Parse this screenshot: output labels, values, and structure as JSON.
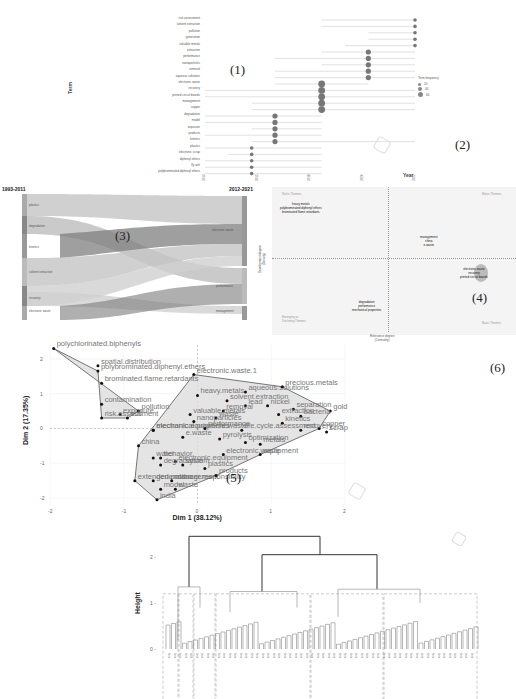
{
  "panels": {
    "p1": {
      "label": "(1)"
    },
    "p2": {
      "label": "(2)"
    },
    "p3": {
      "label": "(3)"
    },
    "p4": {
      "label": "(4)"
    },
    "p5": {
      "label": "(5)"
    },
    "p6": {
      "label": "(6)"
    }
  },
  "chart_data": [
    {
      "type": "scatter",
      "title": "Trend Topics",
      "xlabel": "Year",
      "ylabel": "Term",
      "x_ticks": [
        "2013",
        "2015",
        "2018",
        "2020",
        "2022"
      ],
      "legend": {
        "title": "Term frequency",
        "entries": [
          "20",
          "40",
          "60"
        ],
        "position": "right"
      },
      "terms": [
        {
          "term": "risk assessment",
          "year": 2022,
          "start": 2018,
          "end": 2022,
          "size": 1
        },
        {
          "term": "solvent extraction",
          "year": 2022,
          "start": 2018,
          "end": 2022,
          "size": 1
        },
        {
          "term": "pollution",
          "year": 2022,
          "start": 2020,
          "end": 2022,
          "size": 1
        },
        {
          "term": "generation",
          "year": 2022,
          "start": 2020,
          "end": 2022,
          "size": 1
        },
        {
          "term": "valuable metals",
          "year": 2022,
          "start": 2019,
          "end": 2022,
          "size": 1
        },
        {
          "term": "extraction",
          "year": 2020,
          "start": 2018,
          "end": 2022,
          "size": 2
        },
        {
          "term": "performance",
          "year": 2020,
          "start": 2016,
          "end": 2022,
          "size": 2
        },
        {
          "term": "nanoparticles",
          "year": 2020,
          "start": 2018,
          "end": 2022,
          "size": 2
        },
        {
          "term": "removal",
          "year": 2020,
          "start": 2016,
          "end": 2022,
          "size": 2
        },
        {
          "term": "aqueous solutions",
          "year": 2020,
          "start": 2016,
          "end": 2022,
          "size": 2
        },
        {
          "term": "electronic waste",
          "year": 2018,
          "start": 2016,
          "end": 2020,
          "size": 3
        },
        {
          "term": "recovery",
          "year": 2018,
          "start": 2013,
          "end": 2022,
          "size": 3
        },
        {
          "term": "printed circuit boards",
          "year": 2018,
          "start": 2013,
          "end": 2022,
          "size": 3
        },
        {
          "term": "management",
          "year": 2018,
          "start": 2015,
          "end": 2022,
          "size": 3
        },
        {
          "term": "copper",
          "year": 2018,
          "start": 2015,
          "end": 2022,
          "size": 3
        },
        {
          "term": "degradation",
          "year": 2016,
          "start": 2013,
          "end": 2018,
          "size": 2
        },
        {
          "term": "model",
          "year": 2016,
          "start": 2013,
          "end": 2018,
          "size": 2
        },
        {
          "term": "exposure",
          "year": 2016,
          "start": 2015,
          "end": 2018,
          "size": 2
        },
        {
          "term": "products",
          "year": 2016,
          "start": 2013,
          "end": 2018,
          "size": 2
        },
        {
          "term": "kinetics",
          "year": 2016,
          "start": 2015,
          "end": 2022,
          "size": 2
        },
        {
          "term": "plastics",
          "year": 2015,
          "start": 2013,
          "end": 2018,
          "size": 1
        },
        {
          "term": "electronic scrap",
          "year": 2015,
          "start": 2014,
          "end": 2018,
          "size": 1
        },
        {
          "term": "diphenyl ethers",
          "year": 2015,
          "start": 2013,
          "end": 2018,
          "size": 1
        },
        {
          "term": "fly ash",
          "year": 2015,
          "start": 2013,
          "end": 2018,
          "size": 1
        },
        {
          "term": "polybrominated diphenyl ethers",
          "year": 2015,
          "start": 2013,
          "end": 2018,
          "size": 1
        }
      ]
    },
    {
      "type": "sankey",
      "title": "Thematic Evolution",
      "periods": [
        "1993-2011",
        "2012-2021"
      ],
      "left_nodes": [
        "plastics",
        "degradation",
        "kinetics",
        "solvent extraction",
        "recovery",
        "electronic waste"
      ],
      "right_nodes": [
        "electronic waste",
        "performance",
        "management"
      ],
      "links": [
        {
          "from": "plastics",
          "to": "electronic waste"
        },
        {
          "from": "degradation",
          "to": "performance"
        },
        {
          "from": "kinetics",
          "to": "electronic waste"
        },
        {
          "from": "kinetics",
          "to": "performance"
        },
        {
          "from": "solvent extraction",
          "to": "electronic waste"
        },
        {
          "from": "solvent extraction",
          "to": "performance"
        },
        {
          "from": "recovery",
          "to": "electronic waste"
        },
        {
          "from": "recovery",
          "to": "management"
        },
        {
          "from": "electronic waste",
          "to": "electronic waste"
        },
        {
          "from": "electronic waste",
          "to": "management"
        }
      ]
    },
    {
      "type": "scatter",
      "title": "Thematic Map",
      "xlabel": "Relevance degree (Centrality)",
      "ylabel": "Development degree (Density)",
      "quadrants": [
        "Niche Themes",
        "Motor Themes",
        "Emerging or Declining Themes",
        "Basic Themes"
      ],
      "clusters": [
        {
          "terms": [
            "heavy metals",
            "polybrominated diphenyl ethers",
            "brominated flame retardants"
          ],
          "quadrant": "Niche Themes"
        },
        {
          "terms": [
            "management",
            "china",
            "e-waste"
          ],
          "quadrant": "Motor Themes"
        },
        {
          "terms": [
            "electronic waste",
            "recovery",
            "printed circuit boards"
          ],
          "quadrant": "Basic Themes"
        },
        {
          "terms": [
            "degradation",
            "performance",
            "mechanical properties"
          ],
          "quadrant": "Emerging or Declining Themes"
        }
      ]
    },
    {
      "type": "scatter",
      "title": "Factorial Map",
      "xlabel": "Dim 1 (38.12%)",
      "ylabel": "Dim 2 (17.35%)",
      "xlim": [
        -2,
        2
      ],
      "ylim": [
        -2.2,
        2.4
      ],
      "x_ticks": [
        "-2",
        "-1",
        "0",
        "1",
        "2"
      ],
      "y_ticks": [
        "2",
        "1",
        "0",
        "-1",
        "-2"
      ],
      "points": [
        {
          "label": "polychlorinated.biphenyls",
          "x": -1.95,
          "y": 2.3
        },
        {
          "label": "spatial.distribution",
          "x": -1.35,
          "y": 1.8
        },
        {
          "label": "polybrominated.diphenyl.ethers",
          "x": -1.35,
          "y": 1.65
        },
        {
          "label": "brominated.flame.retardants",
          "x": -1.3,
          "y": 1.3
        },
        {
          "label": "contamination",
          "x": -1.3,
          "y": 0.7
        },
        {
          "label": "pollution",
          "x": -0.8,
          "y": 0.5
        },
        {
          "label": "exposure",
          "x": -1.05,
          "y": 0.4
        },
        {
          "label": "soil",
          "x": -0.95,
          "y": 0.3
        },
        {
          "label": "risk.assessment",
          "x": -1.3,
          "y": 0.3
        },
        {
          "label": "electronic.waste.1",
          "x": -0.05,
          "y": 1.55
        },
        {
          "label": "aqueous.solutions",
          "x": 0.65,
          "y": 1.05
        },
        {
          "label": "precious.metals",
          "x": 1.15,
          "y": 1.2
        },
        {
          "label": "heavy.metals",
          "x": 0.0,
          "y": 0.95
        },
        {
          "label": "solvent.extraction",
          "x": 0.4,
          "y": 0.8
        },
        {
          "label": "lead",
          "x": 0.65,
          "y": 0.65
        },
        {
          "label": "nickel",
          "x": 0.95,
          "y": 0.65
        },
        {
          "label": "separation",
          "x": 1.3,
          "y": 0.55
        },
        {
          "label": "gold",
          "x": 1.8,
          "y": 0.5
        },
        {
          "label": "removal",
          "x": 0.35,
          "y": 0.5
        },
        {
          "label": "extraction",
          "x": 1.1,
          "y": 0.4
        },
        {
          "label": "bacteria",
          "x": 1.4,
          "y": 0.35
        },
        {
          "label": "valuable.metals",
          "x": -0.1,
          "y": 0.4
        },
        {
          "label": "waste",
          "x": 0.25,
          "y": 0.3
        },
        {
          "label": "kinetics",
          "x": 1.15,
          "y": 0.15
        },
        {
          "label": "copper",
          "x": 1.65,
          "y": 0.0
        },
        {
          "label": "nanoparticles",
          "x": -0.05,
          "y": 0.2
        },
        {
          "label": "recovery",
          "x": 1.4,
          "y": -0.05
        },
        {
          "label": "scrap",
          "x": 1.75,
          "y": -0.1
        },
        {
          "label": "electronic.equipment.waste",
          "x": -0.6,
          "y": -0.05
        },
        {
          "label": "mechanical.properties",
          "x": -0.6,
          "y": -0.05
        },
        {
          "label": "performance",
          "x": 0.1,
          "y": 0.0
        },
        {
          "label": "life.cycle.assessment",
          "x": 0.6,
          "y": -0.05
        },
        {
          "label": "china",
          "x": -0.8,
          "y": -0.5
        },
        {
          "label": "e.waste",
          "x": -0.2,
          "y": -0.25
        },
        {
          "label": "pyrolysis",
          "x": 0.3,
          "y": -0.3
        },
        {
          "label": "optimization",
          "x": 0.65,
          "y": -0.4
        },
        {
          "label": "metals",
          "x": 0.85,
          "y": -0.45
        },
        {
          "label": "water",
          "x": -0.6,
          "y": -0.85
        },
        {
          "label": "behavior",
          "x": -0.5,
          "y": -0.85
        },
        {
          "label": "electronic.equipment",
          "x": -0.3,
          "y": -0.95
        },
        {
          "label": "electronic.waste",
          "x": 0.35,
          "y": -0.75
        },
        {
          "label": "degradation",
          "x": -0.5,
          "y": -1.05
        },
        {
          "label": "system",
          "x": -0.2,
          "y": -1.05
        },
        {
          "label": "plastics",
          "x": 0.1,
          "y": -1.15
        },
        {
          "label": "equipment",
          "x": 0.85,
          "y": -0.75
        },
        {
          "label": "extended.producer.responsibility",
          "x": -0.85,
          "y": -1.5
        },
        {
          "label": "generation",
          "x": -0.6,
          "y": -1.5
        },
        {
          "label": "management",
          "x": -0.35,
          "y": -1.5
        },
        {
          "label": "products",
          "x": 0.25,
          "y": -1.35
        },
        {
          "label": "model",
          "x": -0.5,
          "y": -1.75
        },
        {
          "label": "waste2",
          "x": -0.3,
          "y": -1.75
        },
        {
          "label": "india",
          "x": -0.55,
          "y": -2.05
        }
      ],
      "clusters": 2
    },
    {
      "type": "dendrogram",
      "title": "Topic Dendrogram",
      "ylabel": "Height",
      "y_ticks": [
        "2",
        "1",
        "0"
      ],
      "clusters": 6
    }
  ],
  "p1": {
    "ylabel": "Term",
    "xlabel": "Year",
    "legend_title": "Term frequency",
    "legend_items": [
      "20",
      "40",
      "60"
    ]
  },
  "p3": {
    "left_period": "1993-2011",
    "right_period": "2012-2021",
    "left_nodes": [
      "plastics",
      "degradation",
      "kinetics",
      "solvent extraction",
      "recovery",
      "electronic waste"
    ],
    "right_nodes": [
      "electronic waste",
      "performance",
      "management"
    ]
  },
  "p4": {
    "q_niche": "Niche Themes",
    "q_motor": "Motor Themes",
    "q_emerging_1": "Emerging or",
    "q_emerging_2": "Declining Themes",
    "q_basic": "Basic Themes",
    "ylabel_1": "Development degree",
    "ylabel_2": "(Density)",
    "xlabel_1": "Relevance degree",
    "xlabel_2": "(Centrality)",
    "c1": [
      "heavy metals",
      "polybrominated diphenyl ethers",
      "brominated flame retardants"
    ],
    "c2": [
      "management",
      "china",
      "e-waste"
    ],
    "c3": [
      "electronic waste",
      "recovery",
      "printed circuit boards"
    ],
    "c4": [
      "degradation",
      "performance",
      "mechanical properties"
    ]
  },
  "p5": {
    "xlabel": "Dim 1 (38.12%)",
    "ylabel": "Dim 2 (17.35%)"
  },
  "p7": {
    "ylabel": "Height"
  }
}
